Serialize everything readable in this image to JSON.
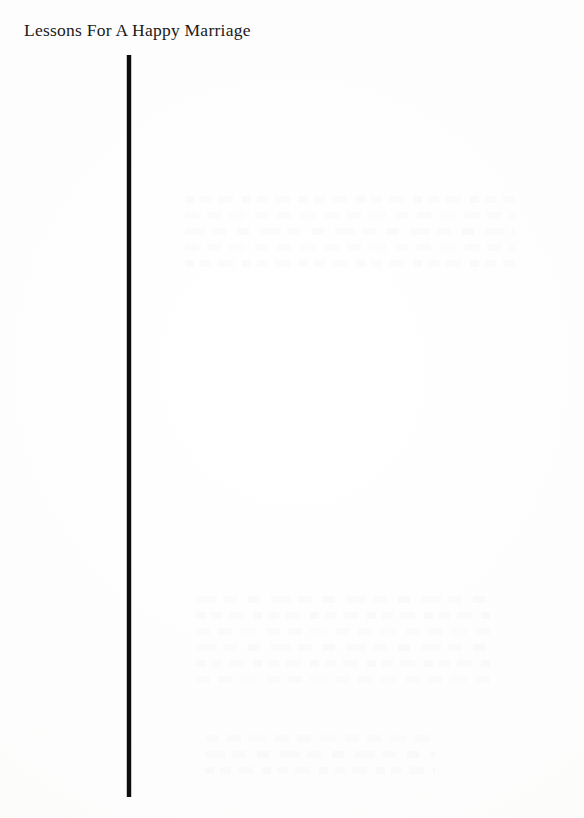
{
  "page": {
    "width": 584,
    "height": 818,
    "background_color": "#fdfdfd",
    "ink_color": "#1a1a1a"
  },
  "running_head": {
    "text": "Lessons For A Happy Marriage",
    "x": 24,
    "y": 19,
    "font_size_px": 17.5,
    "color": "#1a1a1a"
  },
  "vertical_rule": {
    "label": "vertical rule",
    "x": 127,
    "y_top": 55,
    "y_bottom": 797,
    "width_px": 4,
    "color": "#0d0d0d"
  },
  "show_through": {
    "label": "faint show-through from reverse page (illegible)",
    "blocks": [
      {
        "x": 185,
        "y": 196,
        "width": 330,
        "height": 95,
        "lines": 5
      },
      {
        "x": 196,
        "y": 596,
        "width": 300,
        "height": 120,
        "lines": 6
      },
      {
        "x": 205,
        "y": 735,
        "width": 230,
        "height": 45,
        "lines": 3
      }
    ]
  }
}
